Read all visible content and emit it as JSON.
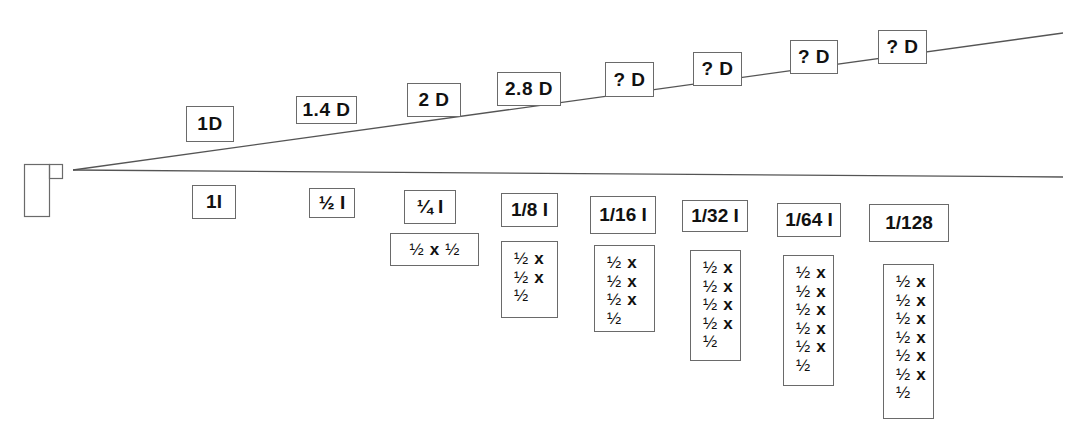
{
  "colors": {
    "stroke": "#6a6a6a",
    "text": "#111111",
    "background": "#ffffff"
  },
  "projector": {
    "icon": "projector-icon"
  },
  "beam": {
    "apex": [
      73,
      170
    ],
    "upper_end": [
      1063,
      33
    ],
    "lower_end": [
      1063,
      177
    ]
  },
  "distances": [
    {
      "label": "1D",
      "x": 186,
      "y": 106,
      "w": 48,
      "h": 36
    },
    {
      "label": "1.4 D",
      "x": 296,
      "y": 96,
      "w": 61,
      "h": 28
    },
    {
      "label": "2 D",
      "x": 407,
      "y": 83,
      "w": 54,
      "h": 34
    },
    {
      "label": "2.8 D",
      "x": 497,
      "y": 72,
      "w": 64,
      "h": 34
    },
    {
      "label": "? D",
      "x": 605,
      "y": 62,
      "w": 49,
      "h": 35
    },
    {
      "label": "? D",
      "x": 693,
      "y": 52,
      "w": 49,
      "h": 34
    },
    {
      "label": "? D",
      "x": 790,
      "y": 40,
      "w": 48,
      "h": 34
    },
    {
      "label": "? D",
      "x": 878,
      "y": 30,
      "w": 49,
      "h": 34
    }
  ],
  "intensities": [
    {
      "label": "1I",
      "x": 192,
      "y": 185,
      "w": 44,
      "h": 34
    },
    {
      "label": "½ I",
      "x": 309,
      "y": 188,
      "w": 46,
      "h": 30
    },
    {
      "label": "¼ I",
      "x": 404,
      "y": 190,
      "w": 52,
      "h": 34
    },
    {
      "label": "1/8 I",
      "x": 501,
      "y": 193,
      "w": 57,
      "h": 34
    },
    {
      "label": "1/16 I",
      "x": 590,
      "y": 196,
      "w": 66,
      "h": 38
    },
    {
      "label": "1/32 I",
      "x": 682,
      "y": 200,
      "w": 66,
      "h": 32
    },
    {
      "label": "1/64 I",
      "x": 777,
      "y": 203,
      "w": 64,
      "h": 34
    },
    {
      "label": "1/128",
      "x": 869,
      "y": 204,
      "w": 80,
      "h": 38
    }
  ],
  "products": {
    "quarter": {
      "half": "½",
      "times": "x",
      "text": "½ x ½",
      "x": 390,
      "y": 233,
      "w": 89,
      "h": 33
    },
    "stacks": [
      {
        "for": "1/8 I",
        "x": 501,
        "y": 241,
        "w": 57,
        "h": 77,
        "rows": [
          "½ x",
          "½ x",
          "½"
        ]
      },
      {
        "for": "1/16 I",
        "x": 594,
        "y": 245,
        "w": 61,
        "h": 87,
        "rows": [
          "½ x",
          "½ x",
          "½ x",
          "½"
        ]
      },
      {
        "for": "1/32 I",
        "x": 690,
        "y": 250,
        "w": 51,
        "h": 111,
        "rows": [
          "½ x",
          "½ x",
          "½ x",
          "½ x",
          "½"
        ]
      },
      {
        "for": "1/64 I",
        "x": 783,
        "y": 255,
        "w": 51,
        "h": 131,
        "rows": [
          "½ x",
          "½ x",
          "½ x",
          "½ x",
          "½ x",
          "½"
        ]
      },
      {
        "for": "1/128",
        "x": 883,
        "y": 264,
        "w": 51,
        "h": 155,
        "rows": [
          "½ x",
          "½ x",
          "½ x",
          "½ x",
          "½ x",
          "½ x",
          "½"
        ]
      }
    ]
  },
  "glyphs": {
    "half": "½",
    "times": "x"
  }
}
